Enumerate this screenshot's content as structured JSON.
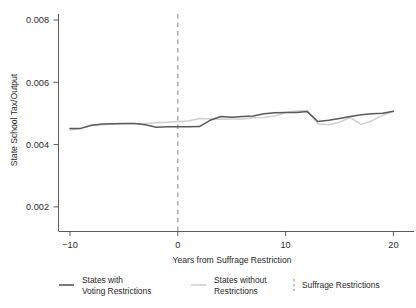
{
  "chart_data": {
    "type": "line",
    "title": "",
    "subtitle": "",
    "xlabel": "Years from Suffrage Restriction",
    "ylabel": "State School Tax/Output",
    "xlim": [
      -12,
      21.5
    ],
    "ylim": [
      0.0012,
      0.00835
    ],
    "xticks": [
      -10,
      0,
      10,
      20
    ],
    "xtick_labels": [
      "−10",
      "0",
      "10",
      "20"
    ],
    "yticks": [
      0.002,
      0.004,
      0.006,
      0.008
    ],
    "ytick_labels": [
      "0.002",
      "0.004",
      "0.006",
      "0.008"
    ],
    "grid": false,
    "legend_position": "below",
    "x": [
      -10,
      -9,
      -8,
      -7,
      -6,
      -5,
      -4,
      -3,
      -2,
      -1,
      0,
      1,
      2,
      3,
      4,
      5,
      6,
      7,
      8,
      9,
      10,
      11,
      12,
      13,
      14,
      15,
      16,
      17,
      18,
      19,
      20
    ],
    "series": [
      {
        "name": "States with Voting Restrictions",
        "color": "#5a5a5e",
        "style": "solid",
        "values": [
          0.00452,
          0.00452,
          0.00462,
          0.00466,
          0.00467,
          0.00468,
          0.00468,
          0.00464,
          0.00456,
          0.00457,
          0.00457,
          0.00457,
          0.00458,
          0.00478,
          0.0049,
          0.00488,
          0.0049,
          0.00492,
          0.00499,
          0.00502,
          0.00503,
          0.00503,
          0.00506,
          0.00474,
          0.00478,
          0.00484,
          0.0049,
          0.00496,
          0.00499,
          0.00501,
          0.00507
        ]
      },
      {
        "name": "States without Restrictions",
        "color": "#cfcfd2",
        "style": "solid",
        "values": [
          0.00447,
          0.00452,
          0.00462,
          0.00464,
          0.00466,
          0.00467,
          0.00467,
          0.00468,
          0.0047,
          0.00472,
          0.00474,
          0.00476,
          0.00484,
          0.00483,
          0.00481,
          0.00482,
          0.00482,
          0.00486,
          0.00487,
          0.00492,
          0.00503,
          0.00508,
          0.00509,
          0.00466,
          0.00464,
          0.00472,
          0.00487,
          0.00465,
          0.00476,
          0.00494,
          0.00506
        ]
      }
    ],
    "annotations": [
      {
        "name": "suffrage-restriction-event",
        "type": "vline",
        "x": 0,
        "style": "dashed",
        "color": "#9a9a9a"
      }
    ],
    "legend": [
      {
        "label_line1": "States with",
        "label_line2": "Voting Restrictions",
        "marker": "solid-line",
        "color": "#5a5a5e"
      },
      {
        "label_line1": "States without",
        "label_line2": "Restrictions",
        "marker": "solid-line",
        "color": "#cfcfd2"
      },
      {
        "label_line1": "Suffrage Restrictions",
        "label_line2": "",
        "marker": "dashed-line",
        "color": "#9a9a9a"
      }
    ]
  }
}
